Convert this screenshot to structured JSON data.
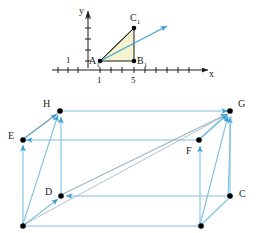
{
  "figure": {
    "colors": {
      "vector_blue": "#3b9fd4",
      "edge_blue": "#7fc0e3",
      "diagonal_gray": "#9bb3c4",
      "axis_black": "#1a1a1a",
      "point_black": "#000000",
      "triangle_fill": "#f5f3cf",
      "triangle_stroke": "#1a1a1a"
    }
  },
  "graph": {
    "axis_x_label": "x",
    "axis_y_label": "y",
    "y_tick_label": "1",
    "x_tick_labels": [
      "1",
      "5"
    ],
    "points": [
      {
        "name": "A1",
        "label": "A",
        "sub": "1"
      },
      {
        "name": "B1",
        "label": "B",
        "sub": "1"
      },
      {
        "name": "C1",
        "label": "C",
        "sub": "1"
      }
    ]
  },
  "box": {
    "vertices": [
      {
        "name": "H",
        "label": "H"
      },
      {
        "name": "G",
        "label": "G"
      },
      {
        "name": "E",
        "label": "E"
      },
      {
        "name": "F",
        "label": "F"
      },
      {
        "name": "D",
        "label": "D"
      },
      {
        "name": "C",
        "label": "C"
      }
    ]
  }
}
